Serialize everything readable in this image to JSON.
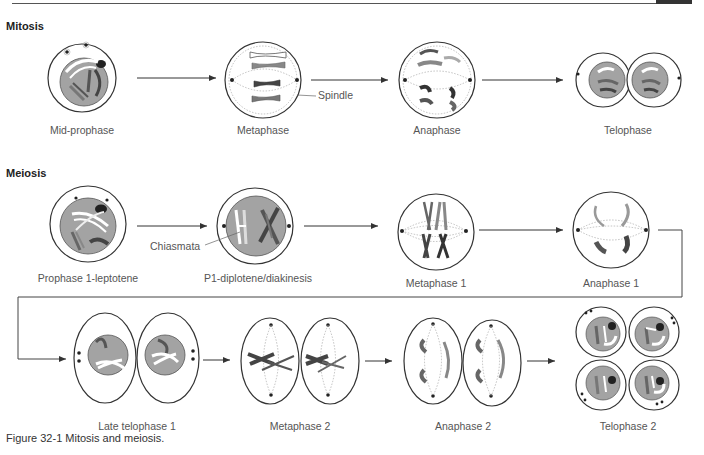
{
  "header": {
    "bar": "",
    "tab": ""
  },
  "sections": {
    "mitosis": {
      "title": "Mitosis"
    },
    "meiosis": {
      "title": "Meiosis"
    }
  },
  "mitosis_stages": [
    {
      "label": "Mid-prophase"
    },
    {
      "label": "Metaphase"
    },
    {
      "label": "Anaphase"
    },
    {
      "label": "Telophase"
    }
  ],
  "mitosis_callouts": {
    "spindle": "Spindle"
  },
  "meiosis_stages_row1": [
    {
      "label": "Prophase 1-leptotene"
    },
    {
      "label": "P1-diplotene/diakinesis"
    },
    {
      "label": "Metaphase 1"
    },
    {
      "label": "Anaphase 1"
    }
  ],
  "meiosis_callouts": {
    "chiasmata": "Chiasmata"
  },
  "meiosis_stages_row2": [
    {
      "label": "Late telophase 1"
    },
    {
      "label": "Metaphase 2"
    },
    {
      "label": "Anaphase 2"
    },
    {
      "label": "Telophase 2"
    }
  ],
  "caption": "Figure 32-1  Mitosis and meiosis.",
  "colors": {
    "nucleus_fill": "#a3a3a3",
    "outline": "#333333",
    "chromosome_dark": "#555555",
    "chromosome_mid": "#8a8a8a",
    "chromosome_light": "#ffffff",
    "spindle": "#888888"
  }
}
